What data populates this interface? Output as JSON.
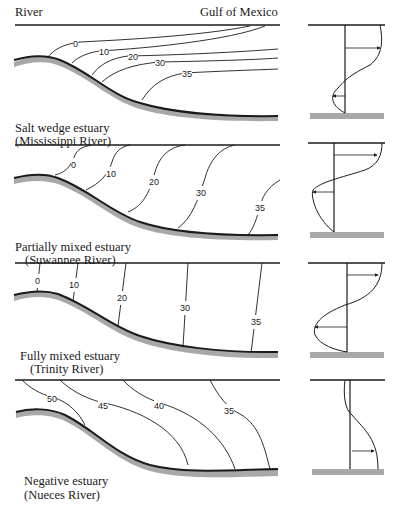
{
  "header": {
    "left_label": "River",
    "right_label": "Gulf of Mexico"
  },
  "panels": [
    {
      "type": "Salt wedge estuary",
      "example": "(Mississippi River)",
      "isohalines": [
        "0",
        "10",
        "20",
        "30",
        "35"
      ]
    },
    {
      "type": "Partially mixed estuary",
      "example": "(Suwannee River)",
      "isohalines": [
        "0",
        "10",
        "20",
        "30",
        "35"
      ]
    },
    {
      "type": "Fully mixed estuary",
      "example": "(Trinity River)",
      "isohalines": [
        "0",
        "10",
        "20",
        "30",
        "35"
      ]
    },
    {
      "type": "Negative estuary",
      "example": "(Nueces River)",
      "isohalines": [
        "50",
        "45",
        "40",
        "35"
      ]
    }
  ],
  "colors": {
    "line": "#1a1a1a",
    "seabed": "#a8a8a8"
  }
}
